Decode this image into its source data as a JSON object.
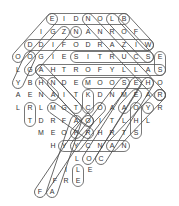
{
  "puzzle": {
    "type": "word-search",
    "letters": [
      {
        "ch": "E",
        "x": 52,
        "y": 19
      },
      {
        "ch": "I",
        "x": 64,
        "y": 19
      },
      {
        "ch": "D",
        "x": 76,
        "y": 19
      },
      {
        "ch": "N",
        "x": 88,
        "y": 19
      },
      {
        "ch": "O",
        "x": 100,
        "y": 19
      },
      {
        "ch": "L",
        "x": 112,
        "y": 19
      },
      {
        "ch": "B",
        "x": 124,
        "y": 19
      },
      {
        "ch": "I",
        "x": 41,
        "y": 32
      },
      {
        "ch": "G",
        "x": 53,
        "y": 32
      },
      {
        "ch": "Z",
        "x": 64,
        "y": 32
      },
      {
        "ch": "N",
        "x": 76,
        "y": 32
      },
      {
        "ch": "A",
        "x": 88,
        "y": 32
      },
      {
        "ch": "N",
        "x": 100,
        "y": 32
      },
      {
        "ch": "R",
        "x": 112,
        "y": 32
      },
      {
        "ch": "O",
        "x": 124,
        "y": 32
      },
      {
        "ch": "F",
        "x": 136,
        "y": 32
      },
      {
        "ch": "D",
        "x": 30,
        "y": 45
      },
      {
        "ch": "D",
        "x": 41,
        "y": 45
      },
      {
        "ch": "I",
        "x": 53,
        "y": 45
      },
      {
        "ch": "F",
        "x": 64,
        "y": 45
      },
      {
        "ch": "O",
        "x": 76,
        "y": 45
      },
      {
        "ch": "D",
        "x": 88,
        "y": 45
      },
      {
        "ch": "R",
        "x": 100,
        "y": 45
      },
      {
        "ch": "A",
        "x": 112,
        "y": 45
      },
      {
        "ch": "Z",
        "x": 124,
        "y": 45
      },
      {
        "ch": "I",
        "x": 136,
        "y": 45
      },
      {
        "ch": "W",
        "x": 148,
        "y": 45
      },
      {
        "ch": "O",
        "x": 18,
        "y": 57
      },
      {
        "ch": "O",
        "x": 30,
        "y": 57
      },
      {
        "ch": "G",
        "x": 41,
        "y": 57
      },
      {
        "ch": "I",
        "x": 53,
        "y": 57
      },
      {
        "ch": "E",
        "x": 64,
        "y": 57
      },
      {
        "ch": "S",
        "x": 76,
        "y": 57
      },
      {
        "ch": "I",
        "x": 88,
        "y": 57
      },
      {
        "ch": "T",
        "x": 100,
        "y": 57
      },
      {
        "ch": "R",
        "x": 112,
        "y": 57
      },
      {
        "ch": "U",
        "x": 124,
        "y": 57
      },
      {
        "ch": "C",
        "x": 136,
        "y": 57
      },
      {
        "ch": "S",
        "x": 148,
        "y": 57
      },
      {
        "ch": "E",
        "x": 160,
        "y": 57
      },
      {
        "ch": "L",
        "x": 18,
        "y": 70
      },
      {
        "ch": "G",
        "x": 30,
        "y": 70
      },
      {
        "ch": "A",
        "x": 41,
        "y": 70
      },
      {
        "ch": "H",
        "x": 53,
        "y": 70
      },
      {
        "ch": "T",
        "x": 64,
        "y": 70
      },
      {
        "ch": "R",
        "x": 76,
        "y": 70
      },
      {
        "ch": "O",
        "x": 88,
        "y": 70
      },
      {
        "ch": "F",
        "x": 100,
        "y": 70
      },
      {
        "ch": "Y",
        "x": 112,
        "y": 70
      },
      {
        "ch": "L",
        "x": 124,
        "y": 70
      },
      {
        "ch": "L",
        "x": 136,
        "y": 70
      },
      {
        "ch": "A",
        "x": 148,
        "y": 70
      },
      {
        "ch": "S",
        "x": 160,
        "y": 70
      },
      {
        "ch": "Y",
        "x": 18,
        "y": 83
      },
      {
        "ch": "B",
        "x": 30,
        "y": 83
      },
      {
        "ch": "H",
        "x": 41,
        "y": 83
      },
      {
        "ch": "N",
        "x": 53,
        "y": 83
      },
      {
        "ch": "D",
        "x": 64,
        "y": 83
      },
      {
        "ch": "E",
        "x": 76,
        "y": 83
      },
      {
        "ch": "M",
        "x": 88,
        "y": 83
      },
      {
        "ch": "O",
        "x": 100,
        "y": 83
      },
      {
        "ch": "O",
        "x": 112,
        "y": 83
      },
      {
        "ch": "S",
        "x": 124,
        "y": 83
      },
      {
        "ch": "E",
        "x": 136,
        "y": 83
      },
      {
        "ch": "H",
        "x": 148,
        "y": 83
      },
      {
        "ch": "O",
        "x": 160,
        "y": 83
      },
      {
        "ch": "A",
        "x": 18,
        "y": 95
      },
      {
        "ch": "E",
        "x": 30,
        "y": 95
      },
      {
        "ch": "N",
        "x": 41,
        "y": 95
      },
      {
        "ch": "A",
        "x": 53,
        "y": 95
      },
      {
        "ch": "I",
        "x": 64,
        "y": 95
      },
      {
        "ch": "T",
        "x": 76,
        "y": 95
      },
      {
        "ch": "K",
        "x": 88,
        "y": 95
      },
      {
        "ch": "D",
        "x": 100,
        "y": 95
      },
      {
        "ch": "N",
        "x": 112,
        "y": 95
      },
      {
        "ch": "M",
        "x": 124,
        "y": 95
      },
      {
        "ch": "E",
        "x": 136,
        "y": 95
      },
      {
        "ch": "A",
        "x": 148,
        "y": 95
      },
      {
        "ch": "R",
        "x": 160,
        "y": 95
      },
      {
        "ch": "L",
        "x": 18,
        "y": 108
      },
      {
        "ch": "R",
        "x": 30,
        "y": 108
      },
      {
        "ch": "L",
        "x": 41,
        "y": 108
      },
      {
        "ch": "M",
        "x": 53,
        "y": 108
      },
      {
        "ch": "G",
        "x": 64,
        "y": 108
      },
      {
        "ch": "T",
        "x": 76,
        "y": 108
      },
      {
        "ch": "C",
        "x": 88,
        "y": 108
      },
      {
        "ch": "O",
        "x": 100,
        "y": 108
      },
      {
        "ch": "A",
        "x": 112,
        "y": 108
      },
      {
        "ch": "A",
        "x": 124,
        "y": 108
      },
      {
        "ch": "O",
        "x": 136,
        "y": 108
      },
      {
        "ch": "Y",
        "x": 148,
        "y": 108
      },
      {
        "ch": "R",
        "x": 160,
        "y": 108
      },
      {
        "ch": "T",
        "x": 30,
        "y": 121
      },
      {
        "ch": "D",
        "x": 41,
        "y": 121
      },
      {
        "ch": "R",
        "x": 53,
        "y": 121
      },
      {
        "ch": "F",
        "x": 64,
        "y": 121
      },
      {
        "ch": "A",
        "x": 76,
        "y": 121
      },
      {
        "ch": "O",
        "x": 88,
        "y": 121
      },
      {
        "ch": "I",
        "x": 100,
        "y": 121
      },
      {
        "ch": "T",
        "x": 112,
        "y": 121
      },
      {
        "ch": "L",
        "x": 124,
        "y": 121
      },
      {
        "ch": "H",
        "x": 136,
        "y": 121
      },
      {
        "ch": "L",
        "x": 148,
        "y": 121
      },
      {
        "ch": "M",
        "x": 41,
        "y": 133
      },
      {
        "ch": "E",
        "x": 53,
        "y": 133
      },
      {
        "ch": "O",
        "x": 64,
        "y": 133
      },
      {
        "ch": "P",
        "x": 76,
        "y": 133
      },
      {
        "ch": "R",
        "x": 88,
        "y": 133
      },
      {
        "ch": "H",
        "x": 100,
        "y": 133
      },
      {
        "ch": "R",
        "x": 112,
        "y": 133
      },
      {
        "ch": "T",
        "x": 124,
        "y": 133
      },
      {
        "ch": "S",
        "x": 136,
        "y": 133
      },
      {
        "ch": "H",
        "x": 53,
        "y": 146
      },
      {
        "ch": "Y",
        "x": 64,
        "y": 146
      },
      {
        "ch": "Y",
        "x": 76,
        "y": 146
      },
      {
        "ch": "C",
        "x": 88,
        "y": 146
      },
      {
        "ch": "N",
        "x": 100,
        "y": 146
      },
      {
        "ch": "A",
        "x": 112,
        "y": 146
      },
      {
        "ch": "N",
        "x": 124,
        "y": 146
      },
      {
        "ch": "L",
        "x": 77,
        "y": 159
      },
      {
        "ch": "O",
        "x": 89,
        "y": 159
      },
      {
        "ch": "C",
        "x": 101,
        "y": 159
      },
      {
        "ch": "I",
        "x": 66,
        "y": 170
      },
      {
        "ch": "L",
        "x": 78,
        "y": 170
      },
      {
        "ch": "E",
        "x": 90,
        "y": 170
      },
      {
        "ch": "F",
        "x": 55,
        "y": 181
      },
      {
        "ch": "R",
        "x": 66,
        "y": 181
      },
      {
        "ch": "E",
        "x": 78,
        "y": 181
      },
      {
        "ch": "F",
        "x": 40,
        "y": 192
      },
      {
        "ch": "A",
        "x": 52,
        "y": 192
      }
    ],
    "found_words": [
      {
        "x1": 52,
        "y1": 19,
        "x2": 124,
        "y2": 19
      },
      {
        "x1": 76,
        "y1": 32,
        "x2": 76,
        "y2": 32
      },
      {
        "x1": 30,
        "y1": 45,
        "x2": 148,
        "y2": 45
      },
      {
        "x1": 76,
        "y1": 57,
        "x2": 148,
        "y2": 57
      },
      {
        "x1": 160,
        "y1": 57,
        "x2": 160,
        "y2": 70
      },
      {
        "x1": 41,
        "y1": 70,
        "x2": 160,
        "y2": 70
      },
      {
        "x1": 88,
        "y1": 83,
        "x2": 148,
        "y2": 83
      },
      {
        "x1": 160,
        "y1": 95,
        "x2": 160,
        "y2": 95
      },
      {
        "x1": 88,
        "y1": 95,
        "x2": 88,
        "y2": 108
      },
      {
        "x1": 30,
        "y1": 108,
        "x2": 30,
        "y2": 121
      },
      {
        "x1": 64,
        "y1": 146,
        "x2": 124,
        "y2": 146
      },
      {
        "x1": 148,
        "y1": 108,
        "x2": 148,
        "y2": 108
      },
      {
        "x1": 136,
        "y1": 108,
        "x2": 136,
        "y2": 133
      },
      {
        "x1": 78,
        "y1": 170,
        "x2": 78,
        "y2": 181
      },
      {
        "x1": 52,
        "y1": 19,
        "x2": 18,
        "y2": 57
      },
      {
        "x1": 64,
        "y1": 32,
        "x2": 30,
        "y2": 70
      },
      {
        "x1": 88,
        "y1": 19,
        "x2": 160,
        "y2": 95
      },
      {
        "x1": 112,
        "y1": 19,
        "x2": 148,
        "y2": 57
      },
      {
        "x1": 124,
        "y1": 19,
        "x2": 148,
        "y2": 45
      },
      {
        "x1": 30,
        "y1": 57,
        "x2": 18,
        "y2": 83
      },
      {
        "x1": 41,
        "y1": 70,
        "x2": 76,
        "y2": 108
      },
      {
        "x1": 41,
        "y1": 83,
        "x2": 53,
        "y2": 95
      },
      {
        "x1": 53,
        "y1": 83,
        "x2": 88,
        "y2": 121
      },
      {
        "x1": 53,
        "y1": 108,
        "x2": 88,
        "y2": 133
      },
      {
        "x1": 76,
        "y1": 121,
        "x2": 52,
        "y2": 192
      },
      {
        "x1": 88,
        "y1": 121,
        "x2": 40,
        "y2": 192
      },
      {
        "x1": 124,
        "y1": 83,
        "x2": 76,
        "y2": 146
      },
      {
        "x1": 136,
        "y1": 83,
        "x2": 88,
        "y2": 159
      },
      {
        "x1": 148,
        "y1": 83,
        "x2": 101,
        "y2": 159
      },
      {
        "x1": 160,
        "y1": 95,
        "x2": 112,
        "y2": 146
      },
      {
        "x1": 136,
        "y1": 95,
        "x2": 124,
        "y2": 108
      },
      {
        "x1": 100,
        "y1": 108,
        "x2": 76,
        "y2": 133
      }
    ],
    "colors": {
      "letter": "#333333",
      "outline": "#555555",
      "background": "#ffffff"
    }
  }
}
